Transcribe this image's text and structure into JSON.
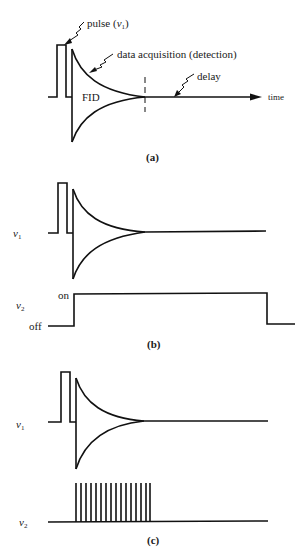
{
  "panel_a": {
    "caption": "(a)",
    "labels": {
      "pulse": "pulse (",
      "pulse_symbol": "ν",
      "pulse_sub": "1",
      "pulse_close": ")",
      "data_acquisition": "data acquisition (detection)",
      "fid": "FID",
      "delay": "delay",
      "time": "time"
    }
  },
  "panel_b": {
    "caption": "(b)",
    "labels": {
      "nu1_symbol": "ν",
      "nu1_sub": "1",
      "nu2_symbol": "ν",
      "nu2_sub": "2",
      "on": "on",
      "off": "off"
    }
  },
  "panel_c": {
    "caption": "(c)",
    "labels": {
      "nu1_symbol": "ν",
      "nu1_sub": "1",
      "nu2_symbol": "ν",
      "nu2_sub": "2"
    },
    "pulse_train_count": 16
  },
  "colors": {
    "line": "#111111",
    "background": "#ffffff"
  }
}
